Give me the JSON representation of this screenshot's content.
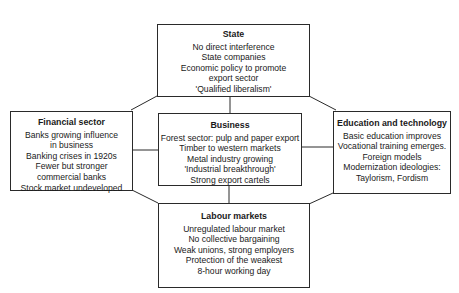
{
  "diagram": {
    "state": {
      "title": "State",
      "items": [
        "No direct interference",
        "State companies",
        "Economic policy to promote",
        "export sector",
        "'Qualified liberalism'"
      ]
    },
    "financial": {
      "title": "Financial sector",
      "items": [
        "Banks growing influence",
        "in business",
        "Banking crises in 1920s",
        "Fewer but stronger",
        "commercial banks",
        "Stock market undeveloped"
      ]
    },
    "business": {
      "title": "Business",
      "items": [
        "Forest sector: pulp and paper export",
        "Timber to western markets",
        "Metal industry growing",
        "'Industrial breakthrough'",
        "Strong export cartels"
      ]
    },
    "education": {
      "title": "Education and technology",
      "items": [
        "Basic education improves",
        "Vocational training emerges.",
        "Foreign models",
        "Modernization ideologies:",
        "Taylorism, Fordism"
      ]
    },
    "labour": {
      "title": "Labour markets",
      "items": [
        "Unregulated labour market",
        "No collective bargaining",
        "Weak unions, strong employers",
        "Protection of the weakest",
        "8-hour working day"
      ]
    }
  }
}
